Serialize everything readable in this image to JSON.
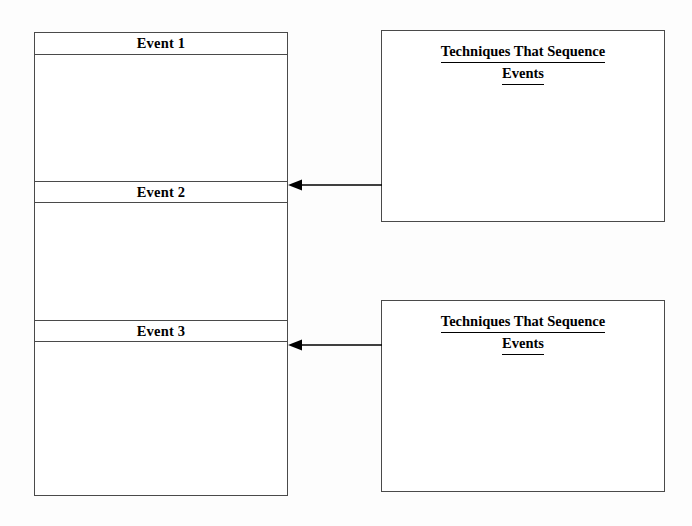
{
  "document": {
    "type": "graphic-organizer",
    "background_color": "#fdfdfd",
    "line_color": "#4a4a4a",
    "text_color": "#000000"
  },
  "events_column": {
    "name": "events-sequence-column",
    "rows": [
      {
        "header": "Event 1",
        "body_text": ""
      },
      {
        "header": "Event 2",
        "body_text": ""
      },
      {
        "header": "Event 3",
        "body_text": ""
      }
    ]
  },
  "technique_boxes": [
    {
      "name": "techniques-box-top",
      "title_line_1": "Techniques That Sequence",
      "title_line_2": "Events",
      "body_text": ""
    },
    {
      "name": "techniques-box-bottom",
      "title_line_1": "Techniques That Sequence",
      "title_line_2": "Events",
      "body_text": ""
    }
  ],
  "connectors": [
    {
      "name": "arrow-techniques-top-to-event-2",
      "direction": "left",
      "from": "techniques-box-top",
      "to": "Event 2"
    },
    {
      "name": "arrow-techniques-bottom-to-event-3",
      "direction": "left",
      "from": "techniques-box-bottom",
      "to": "Event 3"
    }
  ]
}
